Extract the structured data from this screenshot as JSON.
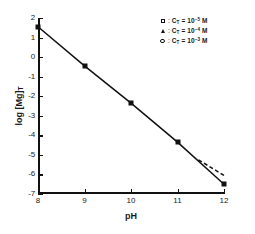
{
  "chart_data": {
    "type": "scatter",
    "title": "",
    "xlabel": "pH",
    "ylabel": "log [Mg]T",
    "ylabel_parts": {
      "prefix": "log [Mg]",
      "subscript": "T"
    },
    "xlim": [
      8,
      12
    ],
    "ylim": [
      -7,
      2
    ],
    "xticks": [
      "8",
      "9",
      "10",
      "11",
      "12"
    ],
    "yticks": [
      "2",
      "1",
      "0",
      "-1",
      "-2",
      "-3",
      "-4",
      "-5",
      "-6",
      "-7"
    ],
    "grid": false,
    "x": [
      8,
      9,
      10,
      11,
      12
    ],
    "series": [
      {
        "name": "log [Mg]T solid",
        "marker": "filled-square",
        "linestyle": "solid",
        "values": [
          1.55,
          -0.45,
          -2.35,
          -4.35,
          -6.5
        ]
      },
      {
        "name": "dashed branch",
        "marker": "none",
        "linestyle": "dashed",
        "x": [
          11.45,
          12
        ],
        "values": [
          -5.25,
          -6.05
        ]
      }
    ],
    "legend_position": "top-right",
    "legend": [
      {
        "marker": "open-square",
        "label": "C_T = 10^-5 M",
        "symbol": "C",
        "subscript": "T",
        "equals": "=",
        "base": "10",
        "exponent": "−5",
        "unit": "M"
      },
      {
        "marker": "filled-triangle",
        "label": "C_T = 10^-4 M",
        "symbol": "C",
        "subscript": "T",
        "equals": "=",
        "base": "10",
        "exponent": "−4",
        "unit": "M"
      },
      {
        "marker": "open-circle",
        "label": "C_T = 10^-3 M",
        "symbol": "C",
        "subscript": "T",
        "equals": "=",
        "base": "10",
        "exponent": "−3",
        "unit": "M"
      }
    ],
    "colors": {
      "line": "#111111",
      "marker": "#111111",
      "background": "#ffffff"
    }
  }
}
